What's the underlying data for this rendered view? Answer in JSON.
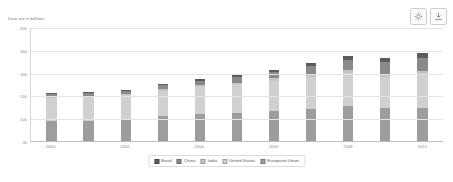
{
  "toolbar": {
    "buttons": [
      {
        "name": "settings-icon",
        "title": "Settings"
      },
      {
        "name": "download-icon",
        "title": "Download"
      }
    ]
  },
  "subtitle": "Data are in billions",
  "chart_data": {
    "type": "bar",
    "stacked": true,
    "title": "",
    "subtitle": "Data are in billions",
    "xlabel": "",
    "ylabel": "",
    "ylim": [
      0,
      50000
    ],
    "grid": true,
    "legend_position": "bottom",
    "categories": [
      "2000",
      "2001",
      "2002",
      "2003",
      "2004",
      "2005",
      "2006",
      "2007",
      "2008",
      "2009",
      "2010"
    ],
    "tick_labels_x": [
      "2000",
      "",
      "2002",
      "",
      "2004",
      "",
      "2006",
      "",
      "2008",
      "",
      "2010"
    ],
    "tick_labels_y": [
      "50k",
      "40k",
      "30k",
      "20k",
      "10k",
      "0k"
    ],
    "tick_values_y": [
      50000,
      40000,
      30000,
      20000,
      10000,
      0
    ],
    "series": [
      {
        "name": "European Union",
        "color": "#9d9d9d",
        "values": [
          8800,
          8900,
          9400,
          10900,
          11800,
          12200,
          13200,
          14200,
          15500,
          14300,
          14300
        ]
      },
      {
        "name": "United States",
        "color": "#d0d0d0",
        "values": [
          10100,
          10400,
          10700,
          11200,
          11900,
          12600,
          13300,
          13800,
          14300,
          13900,
          14500
        ]
      },
      {
        "name": "India",
        "color": "#c4c4c4",
        "values": [
          470,
          490,
          520,
          620,
          720,
          830,
          950,
          1240,
          1220,
          1370,
          1710
        ]
      },
      {
        "name": "China",
        "color": "#8a8a8a",
        "values": [
          1200,
          1330,
          1470,
          1660,
          1960,
          2290,
          2750,
          3550,
          4600,
          5110,
          6100
        ]
      },
      {
        "name": "Brazil",
        "color": "#5c5c5c",
        "values": [
          650,
          560,
          510,
          560,
          670,
          890,
          1110,
          1400,
          1690,
          1670,
          2210
        ]
      }
    ],
    "totals": [
      21220,
      21680,
      22600,
      24940,
      27050,
      28810,
      31310,
      34190,
      37310,
      36350,
      38820
    ]
  }
}
